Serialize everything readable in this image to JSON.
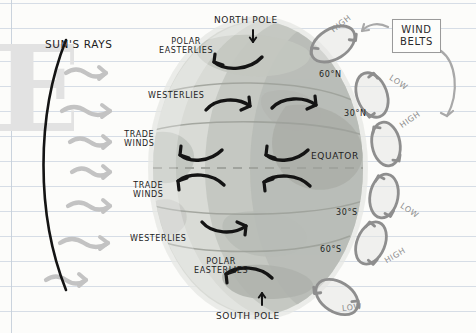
{
  "diagram": {
    "title_box": "WIND\nBELTS",
    "sun_rays_label": "SUN'S RAYS",
    "poles": {
      "north": "NORTH POLE",
      "south": "SOUTH POLE"
    },
    "latitudes": {
      "sixty_n": "60°N",
      "thirty_n": "30°N",
      "equator": "EQUATOR",
      "thirty_s": "30°S",
      "sixty_s": "60°S"
    },
    "wind_belts": [
      {
        "id": "polar-easterlies-north",
        "label": "POLAR\nEASTERLIES"
      },
      {
        "id": "westerlies-north",
        "label": "WESTERLIES"
      },
      {
        "id": "trade-winds-north",
        "label": "TRADE\nWINDS"
      },
      {
        "id": "trade-winds-south",
        "label": "TRADE\nWINDS"
      },
      {
        "id": "westerlies-south",
        "label": "WESTERLIES"
      },
      {
        "id": "polar-easterlies-south",
        "label": "POLAR\nEASTERLIES"
      }
    ],
    "pressure_cells": [
      {
        "id": "cell-1",
        "label": "HIGH",
        "lat": "90°N"
      },
      {
        "id": "cell-2",
        "label": "LOW",
        "lat": "60°N"
      },
      {
        "id": "cell-3",
        "label": "HIGH",
        "lat": "30°N"
      },
      {
        "id": "cell-4",
        "label": "LOW",
        "lat": "30°S"
      },
      {
        "id": "cell-5",
        "label": "HIGH",
        "lat": "60°S"
      },
      {
        "id": "cell-6",
        "label": "LOW",
        "lat": "90°S"
      }
    ],
    "colors": {
      "globe_light": "#d9dbd6",
      "globe_mid": "#c6c9c3",
      "globe_dark": "#a9aca6",
      "ray_grey": "#c3c3c3",
      "ink": "#1d1d1d",
      "rule_blue": "#cfd8e3",
      "callout_grey": "#9a9a9a"
    },
    "watermark_text": "ESS"
  }
}
